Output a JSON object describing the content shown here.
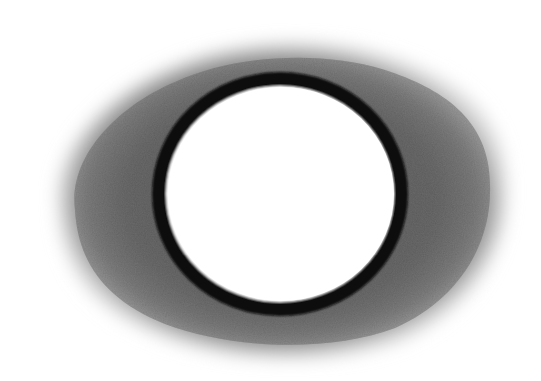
{
  "image": {
    "description": "Pencil/charcoal drawing of a black circular ring with a white interior, surrounded by a soft grey smudged halo",
    "background_color": "#ffffff",
    "halo": {
      "color": "#5a5a5a",
      "cx": 278,
      "cy": 200,
      "rx": 228,
      "ry": 162
    },
    "ring": {
      "color": "#0b0b0b",
      "cx": 280,
      "cy": 194,
      "rx": 121,
      "ry": 115,
      "stroke_width": 14
    },
    "interior": {
      "color": "#ffffff"
    }
  }
}
